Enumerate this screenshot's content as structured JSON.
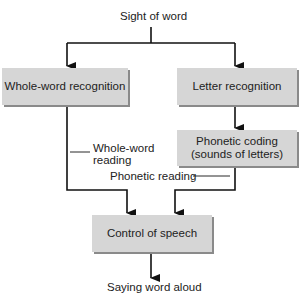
{
  "diagram": {
    "top_label": "Sight of word",
    "bottom_label": "Saying word aloud",
    "boxes": {
      "whole_word": "Whole-word recognition",
      "letter": "Letter recognition",
      "phonetic_line1": "Phonetic coding",
      "phonetic_line2": "(sounds of letters)",
      "speech": "Control of speech"
    },
    "path_labels": {
      "whole_word_line1": "Whole-word",
      "whole_word_line2": "reading",
      "phonetic": "Phonetic reading"
    },
    "colors": {
      "box_fill": "#d6d6d6",
      "box_shadow": "#8a8a8a",
      "line": "#111111"
    }
  }
}
